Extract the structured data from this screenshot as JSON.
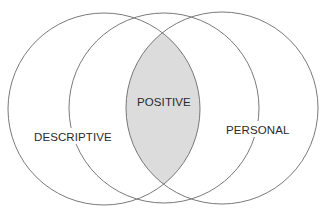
{
  "diagram": {
    "type": "venn",
    "sets": [
      {
        "id": "descriptive",
        "label": "DESCRIPTIVE"
      },
      {
        "id": "middle",
        "label": ""
      },
      {
        "id": "personal",
        "label": "PERSONAL"
      }
    ],
    "intersection": {
      "label": "POSITIVE",
      "of": [
        "descriptive",
        "personal"
      ],
      "fill": "#dcdcdc"
    },
    "stroke_color": "#6a6a6a",
    "background": "#ffffff"
  }
}
